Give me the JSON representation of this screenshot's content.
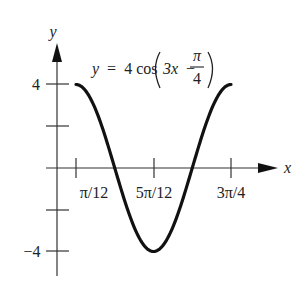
{
  "chart_data": {
    "type": "line",
    "title": "",
    "equation": {
      "lhs": "y",
      "eq": "=",
      "coef": "4",
      "func": "cos",
      "arg_prefix": "3x",
      "minus": "−",
      "frac_num": "π",
      "frac_den": "4"
    },
    "xlabel": "x",
    "ylabel": "y",
    "x_ticks": [
      {
        "label": "π/12",
        "value": 0.2618
      },
      {
        "label": "5π/12",
        "value": 1.309
      },
      {
        "label": "3π/4",
        "value": 2.3562
      }
    ],
    "y_ticks": [
      {
        "label": "4",
        "value": 4
      },
      {
        "label": "",
        "value": 2
      },
      {
        "label": "",
        "value": -2
      },
      {
        "label": "−4",
        "value": -4
      }
    ],
    "xlim": [
      0,
      2.75
    ],
    "ylim": [
      -5,
      5
    ],
    "grid": false,
    "legend": "none",
    "series": [
      {
        "name": "y = 4cos(3x − π/4)",
        "x": [
          0.2618,
          0.5236,
          0.7854,
          1.0472,
          1.309,
          1.5708,
          1.8326,
          2.0944,
          2.3562
        ],
        "y": [
          4,
          2.83,
          0,
          -2.83,
          -4,
          -2.83,
          0,
          2.83,
          4
        ]
      }
    ],
    "colors": {
      "curve": "#111111",
      "axes": "#333333"
    }
  },
  "labels": {
    "tick_x1": "π/12",
    "tick_x2": "5π/12",
    "tick_x3": "3π/4",
    "tick_y_top": "4",
    "tick_y_bottom": "−4",
    "axis_x": "x",
    "axis_y": "y"
  }
}
